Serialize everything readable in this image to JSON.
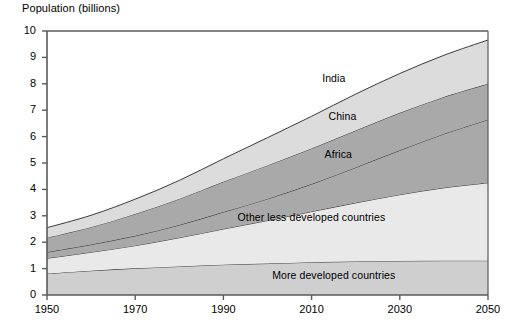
{
  "chart_data": {
    "type": "area",
    "title": "Population (billions)",
    "xlabel": "",
    "ylabel": "Population (billions)",
    "xlim": [
      1950,
      2050
    ],
    "ylim": [
      0,
      10
    ],
    "grid": false,
    "legend_position": "inline-labels",
    "stacked": true,
    "x": [
      1950,
      1960,
      1970,
      1980,
      1990,
      2000,
      2010,
      2020,
      2030,
      2040,
      2050
    ],
    "xticks": [
      "1950",
      "1970",
      "1990",
      "2010",
      "2030",
      "2050"
    ],
    "yticks": [
      "0",
      "1",
      "2",
      "3",
      "4",
      "5",
      "6",
      "7",
      "8",
      "9",
      "10"
    ],
    "series": [
      {
        "name": "More developed countries",
        "color": "#cfcfcf",
        "values": [
          0.81,
          0.92,
          1.01,
          1.08,
          1.15,
          1.19,
          1.24,
          1.27,
          1.29,
          1.3,
          1.3
        ]
      },
      {
        "name": "Other less developed countries",
        "color": "#e9e9e9",
        "values": [
          0.58,
          0.7,
          0.86,
          1.09,
          1.35,
          1.63,
          1.92,
          2.22,
          2.51,
          2.76,
          2.95
        ]
      },
      {
        "name": "Africa",
        "color": "#a9a9a9",
        "values": [
          0.23,
          0.29,
          0.37,
          0.48,
          0.64,
          0.82,
          1.04,
          1.34,
          1.68,
          2.04,
          2.39
        ]
      },
      {
        "name": "China",
        "color": "#a9a9a9",
        "values": [
          0.55,
          0.66,
          0.83,
          0.99,
          1.15,
          1.27,
          1.35,
          1.4,
          1.42,
          1.4,
          1.36
        ]
      },
      {
        "name": "India",
        "color": "#dcdcdc",
        "values": [
          0.38,
          0.45,
          0.56,
          0.7,
          0.87,
          1.05,
          1.22,
          1.38,
          1.49,
          1.58,
          1.66
        ]
      }
    ],
    "stack_tops": {
      "more_developed": [
        0.81,
        0.92,
        1.01,
        1.08,
        1.15,
        1.19,
        1.24,
        1.27,
        1.29,
        1.3,
        1.3
      ],
      "other_less_developed": [
        1.39,
        1.62,
        1.87,
        2.17,
        2.5,
        2.82,
        3.16,
        3.49,
        3.8,
        4.06,
        4.25
      ],
      "africa": [
        1.62,
        1.91,
        2.24,
        2.65,
        3.14,
        3.64,
        4.2,
        4.83,
        5.48,
        6.1,
        6.64
      ],
      "china": [
        2.17,
        2.57,
        3.07,
        3.64,
        4.29,
        4.91,
        5.55,
        6.23,
        6.9,
        7.5,
        8.0
      ],
      "india": [
        2.55,
        3.02,
        3.63,
        4.34,
        5.16,
        5.96,
        6.77,
        7.61,
        8.39,
        9.08,
        9.66
      ]
    },
    "annotations": [
      {
        "name": "India",
        "x": 2015,
        "y": 8.2
      },
      {
        "name": "China",
        "x": 2017,
        "y": 6.75
      },
      {
        "name": "Africa",
        "x": 2016,
        "y": 5.3
      },
      {
        "name": "Other less developed countries",
        "x": 2010,
        "y": 2.9
      },
      {
        "name": "More developed countries",
        "x": 2015,
        "y": 0.72
      }
    ]
  },
  "axis": {
    "title": "Population (billions)",
    "y_labels": [
      "10",
      "9",
      "8",
      "7",
      "6",
      "5",
      "4",
      "3",
      "2",
      "1",
      "0"
    ],
    "x_labels": [
      "1950",
      "1970",
      "1990",
      "2010",
      "2030",
      "2050"
    ]
  },
  "labels": {
    "india": "India",
    "china": "China",
    "africa": "Africa",
    "other_less_developed": "Other less developed countries",
    "more_developed": "More developed countries"
  },
  "colors": {
    "india": "#dcdcdc",
    "china": "#a9a9a9",
    "africa": "#a9a9a9",
    "other_less_developed": "#e9e9e9",
    "more_developed": "#cfcfcf",
    "line": "#3a3a3a",
    "axis": "#5a5a5a"
  }
}
